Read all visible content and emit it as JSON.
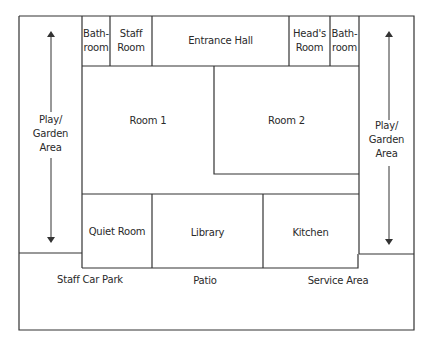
{
  "diagram": {
    "type": "floor-plan",
    "line_color": "#333333",
    "rooms": [
      {
        "id": "bathroom-left",
        "label": "Bath-\nroom"
      },
      {
        "id": "staff-room",
        "label": "Staff\nRoom"
      },
      {
        "id": "entrance-hall",
        "label": "Entrance Hall"
      },
      {
        "id": "heads-room",
        "label": "Head's\nRoom"
      },
      {
        "id": "bathroom-right",
        "label": "Bath-\nroom"
      },
      {
        "id": "room-1",
        "label": "Room 1"
      },
      {
        "id": "room-2",
        "label": "Room 2"
      },
      {
        "id": "quiet-room",
        "label": "Quiet Room"
      },
      {
        "id": "library",
        "label": "Library"
      },
      {
        "id": "kitchen",
        "label": "Kitchen"
      }
    ],
    "outdoor_areas": [
      {
        "id": "play-garden-left",
        "label": "Play/\nGarden\nArea"
      },
      {
        "id": "play-garden-right",
        "label": "Play/\nGarden\nArea"
      },
      {
        "id": "staff-car-park",
        "label": "Staff Car Park"
      },
      {
        "id": "patio",
        "label": "Patio"
      },
      {
        "id": "service-area",
        "label": "Service Area"
      }
    ]
  }
}
